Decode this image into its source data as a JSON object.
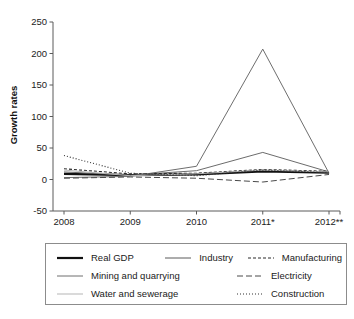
{
  "chart_data": {
    "type": "line",
    "title": "",
    "xlabel": "",
    "ylabel": "Growth rates",
    "categories": [
      "2008",
      "2009",
      "2010",
      "2011*",
      "2012**"
    ],
    "x_tick_labels": [
      "2008",
      "2009",
      "2010",
      "2011*",
      "2012**"
    ],
    "y_tick_labels": [
      "250",
      "200",
      "150",
      "100",
      "50",
      "0",
      "-50"
    ],
    "y_ticks": [
      250,
      200,
      150,
      100,
      50,
      0,
      -50
    ],
    "ylim": [
      -50,
      250
    ],
    "grid": false,
    "legend_position": "below",
    "series": [
      {
        "name": "Real GDP",
        "values": [
          9,
          7,
          8,
          13,
          11
        ],
        "color": "#111111",
        "width": 2.2,
        "dash": "none"
      },
      {
        "name": "Industry",
        "values": [
          12,
          7,
          14,
          43,
          12
        ],
        "color": "#5a5a5a",
        "width": 0.9,
        "dash": "none"
      },
      {
        "name": "Manufacturing",
        "values": [
          17,
          9,
          10,
          16,
          13
        ],
        "color": "#2b2b2b",
        "width": 1.1,
        "dash": "3,2"
      },
      {
        "name": "Mining and quarrying",
        "values": [
          3,
          5,
          21,
          207,
          10
        ],
        "color": "#6e6e6e",
        "width": 1.0,
        "dash": "none"
      },
      {
        "name": "Electricity",
        "values": [
          2,
          4,
          2,
          -4,
          8
        ],
        "color": "#4a4a4a",
        "width": 1.0,
        "dash": "6,3"
      },
      {
        "name": "Water and sewerage",
        "values": [
          15,
          6,
          9,
          15,
          12
        ],
        "color": "#b5b5b5",
        "width": 1.0,
        "dash": "none"
      },
      {
        "name": "Construction",
        "values": [
          38,
          10,
          6,
          15,
          11
        ],
        "color": "#333333",
        "width": 1.1,
        "dash": "1,2"
      }
    ]
  },
  "legend": {
    "rows": [
      [
        {
          "label": "Real GDP",
          "series": 0
        },
        {
          "label": "Industry",
          "series": 1
        },
        {
          "label": "Manufacturing",
          "series": 2
        }
      ],
      [
        {
          "label": "Mining and quarrying",
          "series": 3
        },
        {
          "label": "Electricity",
          "series": 4
        }
      ],
      [
        {
          "label": "Water and sewerage",
          "series": 5
        },
        {
          "label": "Construction",
          "series": 6
        }
      ]
    ],
    "items": [
      {
        "label": "Real GDP"
      },
      {
        "label": "Industry"
      },
      {
        "label": "Manufacturing"
      },
      {
        "label": "Mining and quarrying"
      },
      {
        "label": "Electricity"
      },
      {
        "label": "Water and sewerage"
      },
      {
        "label": "Construction"
      }
    ]
  }
}
